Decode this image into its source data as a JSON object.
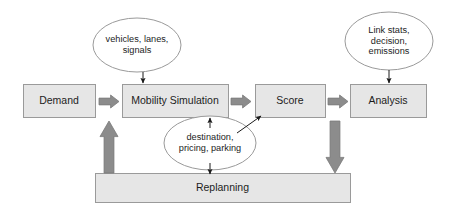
{
  "diagram": {
    "type": "flow-diagram",
    "background_color": "#ffffff",
    "palette": {
      "box_fill": "#e6e6e6",
      "box_stroke": "#9a9a9a",
      "ellipse_fill": "#ffffff",
      "ellipse_stroke": "#9a9a9a",
      "block_arrow_fill": "#8c8c8c",
      "block_arrow_stroke": "#7a7a7a",
      "thin_arrow_stroke": "#1a1a1a",
      "text_color": "#1d1d1d"
    },
    "boxes": [
      {
        "id": "demand",
        "label": "Demand",
        "x": 23,
        "y": 84,
        "w": 72,
        "h": 33
      },
      {
        "id": "mobility-simulation",
        "label": "Mobility Simulation",
        "x": 122,
        "y": 84,
        "w": 106,
        "h": 33
      },
      {
        "id": "score",
        "label": "Score",
        "x": 255,
        "y": 84,
        "w": 70,
        "h": 33
      },
      {
        "id": "analysis",
        "label": "Analysis",
        "x": 350,
        "y": 84,
        "w": 76,
        "h": 33
      },
      {
        "id": "replanning",
        "label": "Replanning",
        "x": 95,
        "y": 173,
        "w": 255,
        "h": 29
      }
    ],
    "ellipses": [
      {
        "id": "simulation-inputs",
        "label": "vehicles, lanes,\nsignals",
        "cx": 137,
        "cy": 45,
        "rx": 44,
        "ry": 27
      },
      {
        "id": "analysis-outputs",
        "label": "Link stats,\ndecision,\nemissions",
        "cx": 389,
        "cy": 41,
        "rx": 44,
        "ry": 29
      },
      {
        "id": "replanning-choices",
        "label": "destination,\npricing, parking",
        "cx": 210,
        "cy": 143,
        "rx": 46,
        "ry": 27
      }
    ],
    "block_arrows": [
      {
        "id": "demand-to-mobility",
        "direction": "right",
        "x": 99,
        "y": 95,
        "w": 20,
        "h": 13
      },
      {
        "id": "mobility-to-score",
        "direction": "right",
        "x": 231,
        "y": 95,
        "w": 20,
        "h": 13
      },
      {
        "id": "score-to-analysis",
        "direction": "right",
        "x": 328,
        "y": 95,
        "w": 20,
        "h": 13
      },
      {
        "id": "replanning-to-demand",
        "direction": "up",
        "x": 100,
        "y": 121,
        "w": 18,
        "h": 52
      },
      {
        "id": "analysis-to-replanning",
        "direction": "down",
        "x": 326,
        "y": 121,
        "w": 18,
        "h": 52
      }
    ],
    "thin_arrows": [
      {
        "id": "simulation-inputs-to-mobility",
        "from": [
          143,
          72
        ],
        "to": [
          143,
          83
        ]
      },
      {
        "id": "analysis-outputs-to-analysis",
        "from": [
          389,
          70
        ],
        "to": [
          389,
          83
        ]
      },
      {
        "id": "replanning-choices-to-mobility",
        "from": [
          210,
          128
        ],
        "to": [
          210,
          118
        ]
      },
      {
        "id": "replanning-choices-to-score",
        "from": [
          237,
          133
        ],
        "to": [
          261,
          116
        ]
      },
      {
        "id": "replanning-choices-to-replanning",
        "from": [
          210,
          163
        ],
        "to": [
          210,
          174
        ]
      }
    ]
  }
}
